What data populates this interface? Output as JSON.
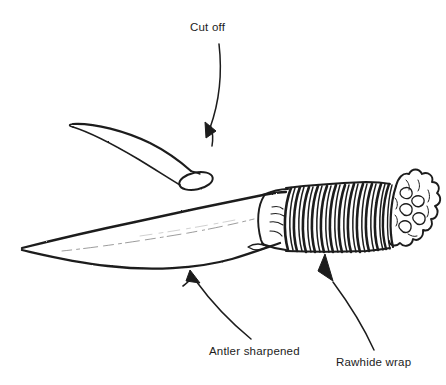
{
  "figure": {
    "type": "line-drawing",
    "background_color": "#ffffff",
    "ink_color": "#1c1c1c",
    "width": 446,
    "height": 385
  },
  "labels": {
    "cut_off": "Cut off",
    "antler_sharpened": "Antler sharpened",
    "rawhide_wrap": "Rawhide wrap"
  },
  "annotations": [
    {
      "id": "cut-off",
      "text": "Cut off",
      "text_position": [
        190,
        21
      ],
      "arrow_from": [
        219,
        44
      ],
      "arrow_to": [
        206,
        137
      ],
      "arrow_direction": "down-left",
      "points_at": "cut-tine-end"
    },
    {
      "id": "antler-sharpened",
      "text": "Antler sharpened",
      "text_position": [
        209,
        345
      ],
      "arrow_from": [
        250,
        337
      ],
      "arrow_to": [
        190,
        270
      ],
      "arrow_direction": "up-left",
      "points_at": "blade-body"
    },
    {
      "id": "rawhide-wrap",
      "text": "Rawhide wrap",
      "text_position": [
        336,
        356
      ],
      "arrow_from": [
        371,
        347
      ],
      "arrow_to": [
        325,
        254
      ],
      "arrow_direction": "up-left",
      "points_at": "rawhide-wrap-coils"
    }
  ],
  "parts": [
    {
      "id": "cut-tine",
      "name": "Cut-off antler tine",
      "description": "Tapered antler tine removed from the main beam, shown above the knife with an oval cut face at its thick end",
      "tip": [
        72,
        124
      ],
      "cut_face_center": [
        196,
        181
      ]
    },
    {
      "id": "blade",
      "name": "Sharpened antler blade",
      "description": "Long curved antler blade tapering to a sharp point at the left",
      "tip": [
        22,
        248
      ],
      "base": [
        285,
        205
      ]
    },
    {
      "id": "rawhide-wrap",
      "name": "Rawhide wrap",
      "description": "Series of tight coil bands wrapped around the handle",
      "band_count": 13,
      "start_x": 284,
      "end_x": 390
    },
    {
      "id": "antler-burr",
      "name": "Antler burr crown",
      "description": "Knobby lobed antler burr forming the pommel at the right end",
      "center": [
        412,
        210
      ]
    }
  ]
}
